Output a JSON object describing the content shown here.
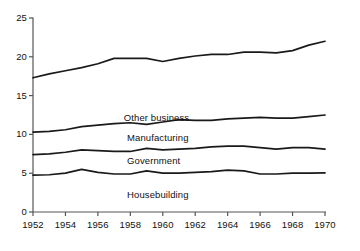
{
  "chart_data": {
    "type": "line",
    "title": "",
    "subtitle": "",
    "xlabel": "",
    "ylabel": "",
    "xlim": [
      1952,
      1970
    ],
    "ylim": [
      0,
      25
    ],
    "grid": false,
    "legend_position": "inline-annotations",
    "x_tick_labels": [
      "1952",
      "1954",
      "1956",
      "1958",
      "1960",
      "1962",
      "1964",
      "1966",
      "1968",
      "1970"
    ],
    "x_tick_values": [
      1952,
      1954,
      1956,
      1958,
      1960,
      1962,
      1964,
      1966,
      1968,
      1970
    ],
    "y_tick_labels": [
      "0",
      "5",
      "10",
      "15",
      "20",
      "25"
    ],
    "y_tick_values": [
      0,
      5,
      10,
      15,
      20,
      25
    ],
    "x": [
      1952,
      1953,
      1954,
      1955,
      1956,
      1957,
      1958,
      1959,
      1960,
      1961,
      1962,
      1963,
      1964,
      1965,
      1966,
      1967,
      1968,
      1969,
      1970
    ],
    "series": [
      {
        "name": "Other business",
        "label": "Other business",
        "label_x": 1957.6,
        "label_y": 12.1,
        "values": [
          17.3,
          17.8,
          18.2,
          18.6,
          19.1,
          19.8,
          19.8,
          19.8,
          19.4,
          19.8,
          20.1,
          20.3,
          20.3,
          20.6,
          20.6,
          20.5,
          20.8,
          21.5,
          22.0
        ]
      },
      {
        "name": "Manufacturing",
        "label": "Manufacturing",
        "label_x": 1957.8,
        "label_y": 9.6,
        "values": [
          10.3,
          10.4,
          10.6,
          11.0,
          11.2,
          11.4,
          11.5,
          11.3,
          11.6,
          11.9,
          11.8,
          11.8,
          12.0,
          12.1,
          12.2,
          12.1,
          12.1,
          12.3,
          12.5
        ]
      },
      {
        "name": "Government",
        "label": "Government",
        "label_x": 1957.8,
        "label_y": 6.6,
        "values": [
          7.4,
          7.5,
          7.7,
          8.0,
          7.9,
          7.8,
          7.8,
          8.2,
          8.0,
          8.1,
          8.2,
          8.4,
          8.5,
          8.5,
          8.3,
          8.1,
          8.3,
          8.3,
          8.1
        ]
      },
      {
        "name": "Housebuilding",
        "label": "Housebuilding",
        "label_x": 1957.8,
        "label_y": 2.2,
        "values": [
          4.75,
          4.8,
          5.0,
          5.5,
          5.1,
          4.9,
          4.9,
          5.3,
          5.0,
          5.0,
          5.1,
          5.2,
          5.4,
          5.3,
          4.9,
          4.9,
          5.0,
          5.0,
          5.05
        ]
      }
    ],
    "colors": {
      "line": "#1a1a1a",
      "axis": "#555555",
      "background": "#ffffff",
      "text": "#111111"
    }
  }
}
